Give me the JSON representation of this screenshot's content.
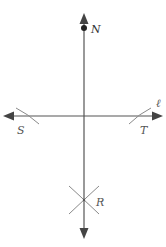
{
  "diagram": {
    "type": "geometric-construction",
    "labels": {
      "point_n": "N",
      "line_l": "ℓ",
      "point_s": "S",
      "point_t": "T",
      "point_r": "R"
    },
    "colors": {
      "line": "#555555",
      "arc": "#8a8a8a",
      "point": "#222222",
      "label": "#555555"
    },
    "elements": [
      {
        "kind": "line",
        "name": "line-l",
        "orientation": "horizontal",
        "arrows": "both"
      },
      {
        "kind": "line",
        "name": "perpendicular-line",
        "orientation": "vertical",
        "arrows": "both"
      },
      {
        "kind": "point",
        "name": "N"
      },
      {
        "kind": "arc",
        "name": "arc-S"
      },
      {
        "kind": "arc",
        "name": "arc-T"
      },
      {
        "kind": "arcs-intersection",
        "name": "R"
      }
    ]
  }
}
